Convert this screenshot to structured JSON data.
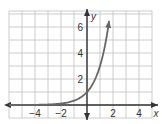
{
  "chart_data": {
    "type": "line",
    "title": "",
    "xlabel": "x",
    "ylabel": "y",
    "function": "y = 3^x",
    "xlim": [
      -6,
      5
    ],
    "ylim": [
      -1,
      7.2
    ],
    "grid": true,
    "grid_step": 1,
    "x_ticks": [
      {
        "value": -4,
        "label": "−4"
      },
      {
        "value": -2,
        "label": "−2"
      },
      {
        "value": 2,
        "label": "2"
      },
      {
        "value": 4,
        "label": "4"
      }
    ],
    "y_ticks": [
      {
        "value": 2,
        "label": "2"
      },
      {
        "value": 4,
        "label": "4"
      },
      {
        "value": 6,
        "label": "6"
      }
    ],
    "series": [
      {
        "name": "exponential curve",
        "x": [
          -6,
          -5,
          -4,
          -3,
          -2,
          -1.5,
          -1,
          -0.5,
          0,
          0.25,
          0.5,
          0.75,
          1,
          1.25,
          1.5,
          1.7
        ],
        "y": [
          0.0014,
          0.0041,
          0.0123,
          0.037,
          0.111,
          0.192,
          0.333,
          0.577,
          1,
          1.316,
          1.732,
          2.28,
          3,
          3.948,
          5.196,
          6.473
        ],
        "left_arrow": true,
        "right_arrow": true
      }
    ],
    "colors": {
      "grid": "#bfbfbf",
      "axis": "#333333",
      "curve": "#666666"
    }
  }
}
